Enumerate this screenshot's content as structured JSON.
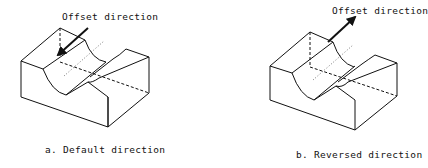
{
  "panels": [
    {
      "id": "a",
      "arrow_label": "Offset direction",
      "caption": "a. Default direction",
      "arrow_orientation": "pointing into the groove surface (down-left)"
    },
    {
      "id": "b",
      "arrow_label": "Offset direction",
      "caption": "b. Reversed direction",
      "arrow_orientation": "pointing away from the groove surface (up-right)"
    }
  ],
  "colors": {
    "line": "#111111",
    "background": "#ffffff"
  }
}
